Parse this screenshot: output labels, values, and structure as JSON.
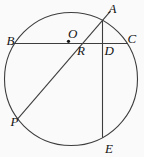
{
  "figure": {
    "type": "geometry-diagram",
    "background": "#fafafa",
    "stroke_color": "#3d3d3d",
    "label_color": "#141414",
    "circle": {
      "cx": 71,
      "cy": 79,
      "r": 66.5
    },
    "center_dot": {
      "x": 68.5,
      "y": 41.3,
      "r": 1.6
    },
    "chords": [
      {
        "name": "chord-bc",
        "x1": 14.5,
        "y1": 43.5,
        "x2": 127.5,
        "y2": 43.5
      },
      {
        "name": "chord-ae",
        "x1": 102.5,
        "y1": 20.4,
        "x2": 102.5,
        "y2": 137.6
      },
      {
        "name": "chord-pa",
        "x1": 17.7,
        "y1": 118.8,
        "x2": 110.7,
        "y2": 10.9
      }
    ],
    "labels": [
      {
        "text": "A",
        "x": 108.5,
        "y": 12.5
      },
      {
        "text": "B",
        "x": 6.5,
        "y": 44.5
      },
      {
        "text": "C",
        "x": 127.5,
        "y": 43
      },
      {
        "text": "D",
        "x": 104.5,
        "y": 54.5
      },
      {
        "text": "E",
        "x": 105,
        "y": 152.5
      },
      {
        "text": "O",
        "x": 68,
        "y": 38
      },
      {
        "text": "P",
        "x": 10.5,
        "y": 125.5
      },
      {
        "text": "R",
        "x": 77,
        "y": 54.5
      }
    ]
  }
}
